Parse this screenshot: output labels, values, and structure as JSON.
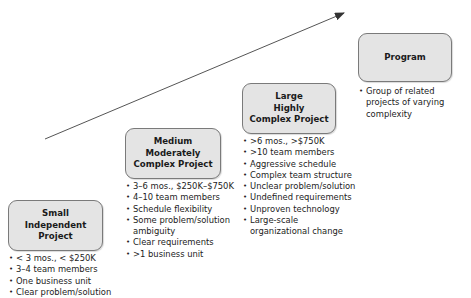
{
  "diagram": {
    "arrow": {
      "x1": 45,
      "y1": 139,
      "x2": 344,
      "y2": 13,
      "color": "#333333"
    },
    "box_fill": "#e4e4e4",
    "box_border": "#7a7a7a",
    "stages": [
      {
        "title_lines": [
          "Small",
          "Independent",
          "Project"
        ],
        "bullets": [
          "< 3 mos., < $250K",
          "3–4 team members",
          "One business unit",
          "Clear problem/solution"
        ]
      },
      {
        "title_lines": [
          "Medium",
          "Moderately",
          "Complex Project"
        ],
        "bullets": [
          "3–6 mos., $250K–$750K",
          "4–10 team members",
          "Schedule flexibility",
          "Some problem/solution ambiguity",
          "Clear requirements",
          ">1 business unit"
        ]
      },
      {
        "title_lines": [
          "Large",
          "Highly",
          "Complex Project"
        ],
        "bullets": [
          ">6 mos., >$750K",
          ">10 team members",
          "Aggressive schedule",
          "Complex team structure",
          "Unclear problem/solution",
          "Undefined requirements",
          "Unproven technology",
          "Large-scale organizational change"
        ]
      },
      {
        "title_lines": [
          "Program"
        ],
        "bullets": [
          "Group of related projects of varying complexity"
        ]
      }
    ]
  }
}
